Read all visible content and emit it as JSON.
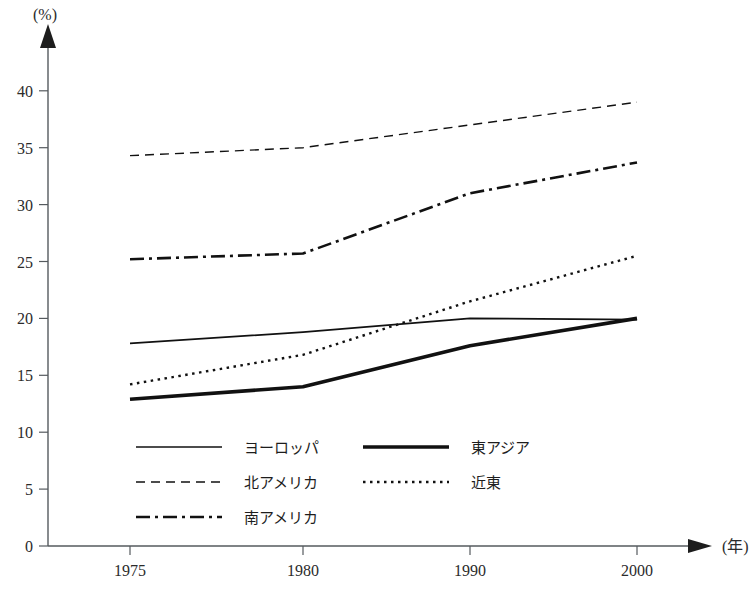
{
  "chart_data": {
    "type": "line",
    "title": "",
    "subtitle": "",
    "xlabel": "(年)",
    "ylabel": "(%)",
    "x": [
      "1975",
      "1980",
      "1990",
      "2000"
    ],
    "categories": [
      "1975",
      "1980",
      "1990",
      "2000"
    ],
    "xtick_labels": [
      "1975",
      "1980",
      "1990",
      "2000"
    ],
    "ytick_labels": [
      "0",
      "5",
      "10",
      "15",
      "20",
      "25",
      "30",
      "35",
      "40"
    ],
    "ytick_values": [
      0,
      5,
      10,
      15,
      20,
      25,
      30,
      35,
      40
    ],
    "ylim": [
      0,
      42
    ],
    "xlim_note": "categorical equal spacing",
    "grid": false,
    "legend_position": "inside-bottom-left",
    "series": [
      {
        "name": "ヨーロッパ",
        "style": "solid-thin",
        "color": "#111111",
        "values": [
          17.8,
          18.8,
          20.0,
          19.9
        ]
      },
      {
        "name": "東アジア",
        "style": "solid-thick",
        "color": "#111111",
        "values": [
          12.9,
          14.0,
          17.6,
          20.0
        ]
      },
      {
        "name": "北アメリカ",
        "style": "dashed",
        "color": "#111111",
        "values": [
          34.3,
          35.0,
          37.0,
          39.0
        ]
      },
      {
        "name": "近東",
        "style": "dotted",
        "color": "#111111",
        "values": [
          14.2,
          16.8,
          21.5,
          25.5
        ]
      },
      {
        "name": "南アメリカ",
        "style": "dash-dot",
        "color": "#111111",
        "values": [
          25.2,
          25.7,
          31.0,
          33.7
        ]
      }
    ]
  },
  "axes": {
    "y_unit_label": "(%)",
    "x_unit_label": "(年)"
  },
  "legend": {
    "entries": [
      {
        "label": "ヨーロッパ",
        "style": "solid-thin",
        "column": 0,
        "row": 0
      },
      {
        "label": "東アジア",
        "style": "solid-thick",
        "column": 1,
        "row": 0
      },
      {
        "label": "北アメリカ",
        "style": "dashed",
        "column": 0,
        "row": 1
      },
      {
        "label": "近東",
        "style": "dotted",
        "column": 1,
        "row": 1
      },
      {
        "label": "南アメリカ",
        "style": "dash-dot",
        "column": 0,
        "row": 2
      }
    ]
  },
  "colors": {
    "ink": "#111111",
    "axis": "#555a5e",
    "background": "#ffffff"
  }
}
